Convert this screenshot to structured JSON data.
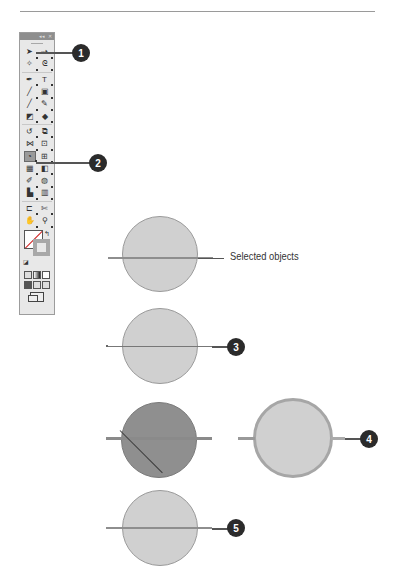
{
  "toolbox": {
    "title_controls": [
      "collapse",
      "close"
    ],
    "rows": [
      [
        {
          "name": "selection-tool",
          "glyph": "➤"
        },
        {
          "name": "direct-selection-tool",
          "glyph": "⇢"
        }
      ],
      [
        {
          "name": "magic-wand-tool",
          "glyph": "✧"
        },
        {
          "name": "lasso-tool",
          "glyph": "ᘓ"
        }
      ],
      [
        {
          "name": "pen-tool",
          "glyph": "✒"
        },
        {
          "name": "type-tool",
          "glyph": "T"
        }
      ],
      [
        {
          "name": "line-segment-tool",
          "glyph": "╱"
        },
        {
          "name": "rectangle-tool",
          "glyph": "▣"
        }
      ],
      [
        {
          "name": "paintbrush-tool",
          "glyph": "╱"
        },
        {
          "name": "pencil-tool",
          "glyph": "✎"
        }
      ],
      [
        {
          "name": "blob-brush-tool",
          "glyph": "◩"
        },
        {
          "name": "eraser-tool",
          "glyph": "◆"
        }
      ],
      [
        {
          "name": "rotate-tool",
          "glyph": "↺"
        },
        {
          "name": "scale-tool",
          "glyph": "⧉"
        }
      ],
      [
        {
          "name": "width-tool",
          "glyph": "⋈"
        },
        {
          "name": "free-transform-tool",
          "glyph": "⊡"
        }
      ],
      [
        {
          "name": "shape-builder-tool",
          "glyph": "◔",
          "active": true
        },
        {
          "name": "perspective-grid-tool",
          "glyph": "⊞"
        }
      ],
      [
        {
          "name": "mesh-tool",
          "glyph": "▦"
        },
        {
          "name": "gradient-tool",
          "glyph": "◧"
        }
      ],
      [
        {
          "name": "eyedropper-tool",
          "glyph": "✐"
        },
        {
          "name": "blend-tool",
          "glyph": "◍"
        }
      ],
      [
        {
          "name": "symbol-sprayer-tool",
          "glyph": "▙"
        },
        {
          "name": "column-graph-tool",
          "glyph": "▥"
        }
      ],
      [
        {
          "name": "artboard-tool",
          "glyph": "⊏"
        },
        {
          "name": "slice-tool",
          "glyph": "✄"
        }
      ],
      [
        {
          "name": "hand-tool",
          "glyph": "✋"
        },
        {
          "name": "zoom-tool",
          "glyph": "⚲"
        }
      ]
    ],
    "swap_glyph": "↰",
    "defaults_glyph": "◪",
    "screen_mode": "change-screen-mode"
  },
  "callouts": [
    {
      "num": "1"
    },
    {
      "num": "2"
    },
    {
      "num": "3"
    },
    {
      "num": "4"
    },
    {
      "num": "5"
    }
  ],
  "figure": {
    "selected_objects_label": "Selected objects"
  },
  "colors": {
    "circle_fill": "#d0d0d0",
    "circle_fill_dark": "#8f8f8f",
    "badge": "#2b2b2b",
    "path": "#8e8e8e"
  }
}
